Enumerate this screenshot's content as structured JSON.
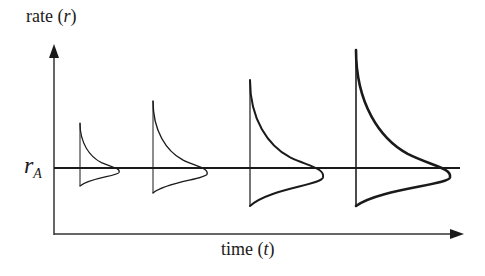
{
  "diagram": {
    "y_axis": {
      "label_text": "rate (",
      "label_var": "r",
      "label_close": ")"
    },
    "x_axis": {
      "label_text": "time (",
      "label_var": "t",
      "label_close": ")"
    },
    "reference_line": {
      "label_main": "r",
      "label_sub": "A"
    },
    "spikes": [
      {
        "id": 1,
        "x": 80,
        "top": 123,
        "bottom": 186,
        "bulge_x": 119,
        "stroke": 1.2
      },
      {
        "id": 2,
        "x": 153,
        "top": 101,
        "bottom": 193,
        "bulge_x": 207,
        "stroke": 1.4
      },
      {
        "id": 3,
        "x": 250,
        "top": 80,
        "bottom": 206,
        "bulge_x": 323,
        "stroke": 2.0
      },
      {
        "id": 4,
        "x": 356,
        "top": 50,
        "bottom": 206,
        "bulge_x": 450,
        "stroke": 2.6
      }
    ],
    "colors": {
      "line": "#1a1a1a",
      "axis": "#333333",
      "background": "#ffffff"
    }
  }
}
